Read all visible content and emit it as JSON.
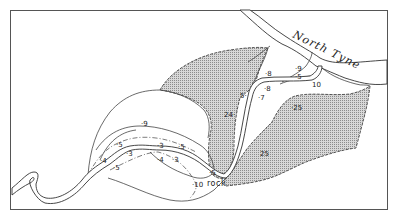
{
  "map": {
    "river_name": "North Tyne",
    "feature_label": "rock",
    "labels": [
      {
        "id": "l9a",
        "text": "·9",
        "x": 141,
        "y": 126
      },
      {
        "id": "l5a",
        "text": "·5",
        "x": 116,
        "y": 147
      },
      {
        "id": "l4",
        "text": "·4",
        "x": 100,
        "y": 163
      },
      {
        "id": "l5b",
        "text": "·5",
        "x": 113,
        "y": 170
      },
      {
        "id": "l3a",
        "text": "·3",
        "x": 126,
        "y": 156
      },
      {
        "id": "l3b",
        "text": "·3",
        "x": 157,
        "y": 148
      },
      {
        "id": "l5c",
        "text": "·5",
        "x": 178,
        "y": 149
      },
      {
        "id": "l4b",
        "text": "·4",
        "x": 157,
        "y": 162
      },
      {
        "id": "l3c",
        "text": "·3",
        "x": 172,
        "y": 162
      },
      {
        "id": "l5d",
        "text": "·5",
        "x": 209,
        "y": 175
      },
      {
        "id": "l10a",
        "text": "·10",
        "x": 192,
        "y": 187
      },
      {
        "id": "l24",
        "text": "24·",
        "x": 224,
        "y": 117
      },
      {
        "id": "l5e",
        "text": "5·",
        "x": 240,
        "y": 98
      },
      {
        "id": "l7",
        "text": "·7",
        "x": 258,
        "y": 100
      },
      {
        "id": "l8a",
        "text": "·8",
        "x": 265,
        "y": 76
      },
      {
        "id": "l8b",
        "text": "·8",
        "x": 264,
        "y": 91
      },
      {
        "id": "l9b",
        "text": "·9",
        "x": 295,
        "y": 71
      },
      {
        "id": "l5f",
        "text": "·5",
        "x": 295,
        "y": 79
      },
      {
        "id": "l10b",
        "text": "10",
        "x": 312,
        "y": 87
      },
      {
        "id": "l25a",
        "text": "·25",
        "x": 291,
        "y": 110
      },
      {
        "id": "l25b",
        "text": "25",
        "x": 260,
        "y": 156
      }
    ]
  },
  "colors": {
    "ink": "#333333",
    "hatch": "#9a9a9a",
    "paper": "#ffffff"
  }
}
